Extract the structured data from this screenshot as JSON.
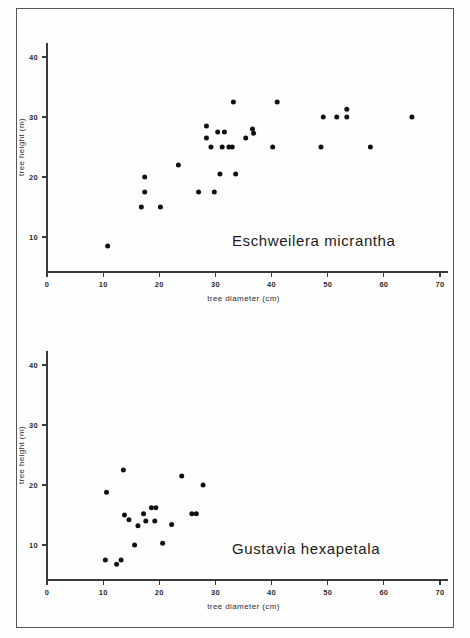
{
  "figure": {
    "background_color": "#fefefe",
    "ink_color": "#111111",
    "axis_color": "#3a3a3a",
    "border": true
  },
  "panels": [
    {
      "id": "eschweilera",
      "species_label": "Eschweilera micrantha",
      "xlabel": "tree diameter (cm)",
      "ylabel": "tree height (m)",
      "xticks": [
        "0",
        "10",
        "20",
        "30",
        "40",
        "50",
        "60",
        "70"
      ],
      "yticks": [
        "10",
        "20",
        "30",
        "40"
      ]
    },
    {
      "id": "gustavia",
      "species_label": "Gustavia hexapetala",
      "xlabel": "tree diameter (cm)",
      "ylabel": "tree height (m)",
      "xticks": [
        "0",
        "10",
        "20",
        "30",
        "40",
        "50",
        "60",
        "70"
      ],
      "yticks": [
        "10",
        "20",
        "30",
        "40"
      ]
    }
  ],
  "chart_data": [
    {
      "type": "scatter",
      "title": "Eschweilera micrantha",
      "xlabel": "tree diameter (cm)",
      "ylabel": "tree height (m)",
      "xlim": [
        0,
        70
      ],
      "ylim": [
        0,
        44
      ],
      "xticks": [
        0,
        10,
        20,
        30,
        40,
        50,
        60,
        70
      ],
      "yticks": [
        10,
        20,
        30,
        40
      ],
      "grid": false,
      "legend": "none",
      "marker": "filled-circle",
      "points": [
        {
          "x": 10.8,
          "y": 8.5
        },
        {
          "x": 16.8,
          "y": 15.0
        },
        {
          "x": 17.4,
          "y": 20.0
        },
        {
          "x": 17.4,
          "y": 17.5
        },
        {
          "x": 20.2,
          "y": 15.0
        },
        {
          "x": 23.4,
          "y": 22.0
        },
        {
          "x": 27.0,
          "y": 17.5
        },
        {
          "x": 28.4,
          "y": 26.5
        },
        {
          "x": 28.4,
          "y": 28.5
        },
        {
          "x": 29.8,
          "y": 17.5
        },
        {
          "x": 30.4,
          "y": 27.5
        },
        {
          "x": 29.2,
          "y": 25.0
        },
        {
          "x": 30.8,
          "y": 20.5
        },
        {
          "x": 31.6,
          "y": 27.5
        },
        {
          "x": 31.2,
          "y": 25.0
        },
        {
          "x": 32.4,
          "y": 25.0
        },
        {
          "x": 33.0,
          "y": 25.0
        },
        {
          "x": 33.2,
          "y": 32.5
        },
        {
          "x": 33.6,
          "y": 20.5
        },
        {
          "x": 35.4,
          "y": 26.5
        },
        {
          "x": 36.6,
          "y": 28.0
        },
        {
          "x": 36.8,
          "y": 27.3
        },
        {
          "x": 40.2,
          "y": 25.0
        },
        {
          "x": 41.0,
          "y": 32.5
        },
        {
          "x": 48.8,
          "y": 25.0
        },
        {
          "x": 49.2,
          "y": 30.0
        },
        {
          "x": 51.6,
          "y": 30.0
        },
        {
          "x": 53.4,
          "y": 31.3
        },
        {
          "x": 53.4,
          "y": 30.0
        },
        {
          "x": 57.6,
          "y": 25.0
        },
        {
          "x": 65.0,
          "y": 30.0
        }
      ]
    },
    {
      "type": "scatter",
      "title": "Gustavia hexapetala",
      "xlabel": "tree diameter (cm)",
      "ylabel": "tree height (m)",
      "xlim": [
        0,
        70
      ],
      "ylim": [
        0,
        44
      ],
      "xticks": [
        0,
        10,
        20,
        30,
        40,
        50,
        60,
        70
      ],
      "yticks": [
        10,
        20,
        30,
        40
      ],
      "grid": false,
      "legend": "none",
      "marker": "filled-circle",
      "points": [
        {
          "x": 10.4,
          "y": 7.5
        },
        {
          "x": 10.6,
          "y": 18.8
        },
        {
          "x": 12.4,
          "y": 6.8
        },
        {
          "x": 13.2,
          "y": 7.5
        },
        {
          "x": 13.6,
          "y": 22.5
        },
        {
          "x": 13.8,
          "y": 15.0
        },
        {
          "x": 14.6,
          "y": 14.2
        },
        {
          "x": 15.6,
          "y": 10.0
        },
        {
          "x": 16.2,
          "y": 13.2
        },
        {
          "x": 17.2,
          "y": 15.2
        },
        {
          "x": 17.6,
          "y": 14.0
        },
        {
          "x": 18.6,
          "y": 16.2
        },
        {
          "x": 19.4,
          "y": 16.2
        },
        {
          "x": 19.2,
          "y": 14.0
        },
        {
          "x": 20.6,
          "y": 10.3
        },
        {
          "x": 22.2,
          "y": 13.4
        },
        {
          "x": 24.0,
          "y": 21.5
        },
        {
          "x": 25.8,
          "y": 15.2
        },
        {
          "x": 26.6,
          "y": 15.2
        },
        {
          "x": 27.8,
          "y": 20.0
        }
      ]
    }
  ]
}
